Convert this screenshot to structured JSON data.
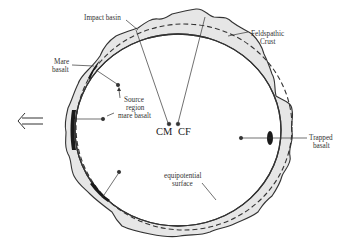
{
  "diagram": {
    "title": "",
    "labels": {
      "impact_basin": "Impact basin",
      "feldspathic_crust_line1": "Feldspathic",
      "feldspathic_crust_line2": "Crust",
      "mare_basalt_line1": "Mare",
      "mare_basalt_line2": "basalt",
      "source_region_line1": "Source",
      "source_region_line2": "region",
      "source_region_line3": "mare basalt",
      "cm": "CM",
      "cf": "CF",
      "trapped_basalt_line1": "Trapped",
      "trapped_basalt_line2": "basalt",
      "equipotential_line1": "equipotential",
      "equipotential_line2": "surface"
    },
    "arrow": {
      "direction": "left",
      "glyph": "double-arrow-left",
      "meaning": "toward Earth"
    },
    "colors": {
      "crust_fill": "#e6e6e6",
      "outline": "#333333",
      "basalt": "#1a1a1a",
      "background": "#ffffff"
    }
  }
}
